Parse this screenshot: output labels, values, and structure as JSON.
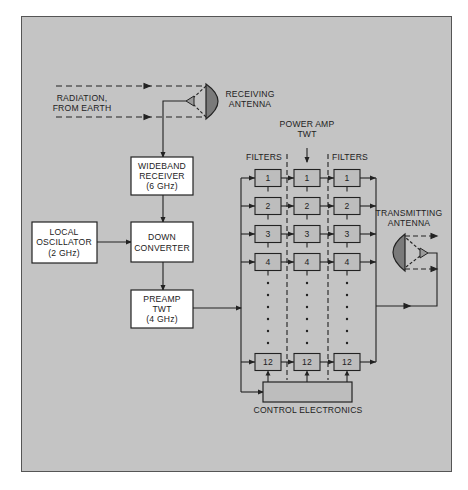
{
  "caption": "refrainations such as the above ... a satellite transponder",
  "diagram": {
    "radiation_label": [
      "RADIATION,",
      "FROM EARTH"
    ],
    "receiving_antenna_label": [
      "RECEIVING",
      "ANTENNA"
    ],
    "wideband_receiver": [
      "WIDEBAND",
      "RECEIVER",
      "(6 GHz)"
    ],
    "local_oscillator": [
      "LOCAL",
      "OSCILLATOR",
      "(2 GHz)"
    ],
    "down_converter": [
      "DOWN",
      "CONVERTER"
    ],
    "preamp": [
      "PREAMP",
      "TWT",
      "(4 GHz)"
    ],
    "power_amp_label": [
      "POWER AMP",
      "TWT"
    ],
    "filters_left_label": "FILTERS",
    "filters_right_label": "FILTERS",
    "transmitting_antenna_label": [
      "TRANSMITTING",
      "ANTENNA"
    ],
    "control_electronics_label": "CONTROL ELECTRONICS",
    "channels": [
      "1",
      "2",
      "3",
      "4",
      "12"
    ],
    "colors": {
      "background": "#c4c4c4",
      "box_white": "#ffffff",
      "channel_box": "#bdbdbd",
      "dish": "#7a7a7a",
      "line": "#222222"
    }
  }
}
